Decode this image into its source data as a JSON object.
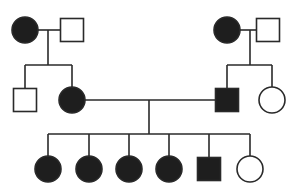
{
  "diagram": {
    "type": "pedigree",
    "colors": {
      "affected": "#1e1e1e",
      "unaffected": "#ffffff",
      "line": "#2a2a2a"
    },
    "individuals": [
      {
        "id": "I-1",
        "generation": 1,
        "sex": "female",
        "affected": true,
        "x": 25,
        "y": 30
      },
      {
        "id": "I-2",
        "generation": 1,
        "sex": "male",
        "affected": false,
        "x": 72,
        "y": 30
      },
      {
        "id": "I-3",
        "generation": 1,
        "sex": "female",
        "affected": true,
        "x": 227,
        "y": 30
      },
      {
        "id": "I-4",
        "generation": 1,
        "sex": "male",
        "affected": false,
        "x": 268,
        "y": 30
      },
      {
        "id": "II-1",
        "generation": 2,
        "sex": "male",
        "affected": false,
        "x": 25,
        "y": 100
      },
      {
        "id": "II-2",
        "generation": 2,
        "sex": "female",
        "affected": true,
        "x": 72,
        "y": 100
      },
      {
        "id": "II-3",
        "generation": 2,
        "sex": "male",
        "affected": true,
        "x": 227,
        "y": 100
      },
      {
        "id": "II-4",
        "generation": 2,
        "sex": "female",
        "affected": false,
        "x": 272,
        "y": 100
      },
      {
        "id": "III-1",
        "generation": 3,
        "sex": "female",
        "affected": true,
        "x": 48,
        "y": 169
      },
      {
        "id": "III-2",
        "generation": 3,
        "sex": "female",
        "affected": true,
        "x": 89,
        "y": 169
      },
      {
        "id": "III-3",
        "generation": 3,
        "sex": "female",
        "affected": true,
        "x": 129,
        "y": 169
      },
      {
        "id": "III-4",
        "generation": 3,
        "sex": "female",
        "affected": true,
        "x": 169,
        "y": 169
      },
      {
        "id": "III-5",
        "generation": 3,
        "sex": "male",
        "affected": true,
        "x": 209,
        "y": 169
      },
      {
        "id": "III-6",
        "generation": 3,
        "sex": "female",
        "affected": false,
        "x": 250,
        "y": 169
      }
    ],
    "matings": [
      {
        "partners": [
          "I-1",
          "I-2"
        ],
        "children": [
          "II-1",
          "II-2"
        ]
      },
      {
        "partners": [
          "I-3",
          "I-4"
        ],
        "children": [
          "II-3",
          "II-4"
        ]
      },
      {
        "partners": [
          "II-2",
          "II-3"
        ],
        "children": [
          "III-1",
          "III-2",
          "III-3",
          "III-4",
          "III-5",
          "III-6"
        ]
      }
    ]
  }
}
